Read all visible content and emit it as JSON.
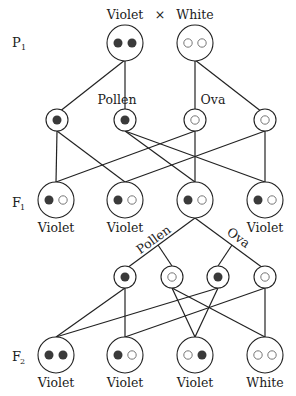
{
  "title": {
    "parent1": "Violet",
    "cross_symbol": "×",
    "parent2": "White"
  },
  "generations": {
    "p1": {
      "letter": "P",
      "sub": "1"
    },
    "f1": {
      "letter": "F",
      "sub": "1"
    },
    "f2": {
      "letter": "F",
      "sub": "2"
    }
  },
  "gamete_labels": {
    "pollen_top": "Pollen",
    "ova_top": "Ova",
    "pollen_bottom": "Pollen",
    "ova_bottom": "Ova"
  },
  "colors": {
    "dominant_allele": "#3a3a3a",
    "recessive_allele": "#ffffff",
    "line": "#222222"
  },
  "p1": [
    {
      "alleles": [
        "dominant",
        "dominant"
      ],
      "phenotype": "Violet"
    },
    {
      "alleles": [
        "recessive",
        "recessive"
      ],
      "phenotype": "White"
    }
  ],
  "p1_gametes": [
    {
      "type": "pollen",
      "allele": "dominant"
    },
    {
      "type": "pollen",
      "allele": "dominant"
    },
    {
      "type": "ova",
      "allele": "recessive"
    },
    {
      "type": "ova",
      "allele": "recessive"
    }
  ],
  "f1": [
    {
      "alleles": [
        "dominant",
        "recessive"
      ],
      "phenotype": "Violet"
    },
    {
      "alleles": [
        "dominant",
        "recessive"
      ],
      "phenotype": "Violet"
    },
    {
      "alleles": [
        "dominant",
        "recessive"
      ],
      "phenotype": ""
    },
    {
      "alleles": [
        "dominant",
        "recessive"
      ],
      "phenotype": "Violet"
    }
  ],
  "f1_labels": [
    "Violet",
    "Violet",
    "Violet"
  ],
  "f1_gametes": [
    {
      "type": "pollen",
      "allele": "dominant"
    },
    {
      "type": "pollen",
      "allele": "recessive"
    },
    {
      "type": "ova",
      "allele": "dominant"
    },
    {
      "type": "ova",
      "allele": "recessive"
    }
  ],
  "f2": [
    {
      "alleles": [
        "dominant",
        "dominant"
      ],
      "phenotype": "Violet"
    },
    {
      "alleles": [
        "dominant",
        "recessive"
      ],
      "phenotype": "Violet"
    },
    {
      "alleles": [
        "recessive",
        "dominant"
      ],
      "phenotype": "Violet"
    },
    {
      "alleles": [
        "recessive",
        "recessive"
      ],
      "phenotype": "White"
    }
  ]
}
